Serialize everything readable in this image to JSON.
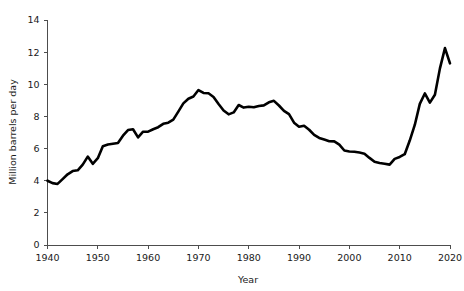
{
  "chart_data": {
    "type": "line",
    "title": "",
    "xlabel": "Year",
    "ylabel": "Million barrels per day",
    "xlim": [
      1940,
      2020
    ],
    "ylim": [
      0,
      14
    ],
    "grid": false,
    "legend": "none",
    "x_ticks": [
      1940,
      1950,
      1960,
      1970,
      1980,
      1990,
      2000,
      2010,
      2020
    ],
    "y_ticks": [
      0,
      2,
      4,
      6,
      8,
      10,
      12,
      14
    ],
    "line_color": "#000000",
    "axis_color": "#4d4d4d",
    "series": [
      {
        "name": "Million barrels per day",
        "x": [
          1940,
          1941,
          1942,
          1943,
          1944,
          1945,
          1946,
          1947,
          1948,
          1949,
          1950,
          1951,
          1952,
          1953,
          1954,
          1955,
          1956,
          1957,
          1958,
          1959,
          1960,
          1961,
          1962,
          1963,
          1964,
          1965,
          1966,
          1967,
          1968,
          1969,
          1970,
          1971,
          1972,
          1973,
          1974,
          1975,
          1976,
          1977,
          1978,
          1979,
          1980,
          1981,
          1982,
          1983,
          1984,
          1985,
          1986,
          1987,
          1988,
          1989,
          1990,
          1991,
          1992,
          1993,
          1994,
          1995,
          1996,
          1997,
          1998,
          1999,
          2000,
          2001,
          2002,
          2003,
          2004,
          2005,
          2006,
          2007,
          2008,
          2009,
          2010,
          2011,
          2012,
          2013,
          2014,
          2015,
          2016,
          2017,
          2018,
          2019,
          2020
        ],
        "y": [
          4.0,
          3.85,
          3.8,
          4.1,
          4.4,
          4.6,
          4.65,
          5.0,
          5.5,
          5.05,
          5.4,
          6.15,
          6.25,
          6.3,
          6.35,
          6.8,
          7.15,
          7.2,
          6.7,
          7.05,
          7.05,
          7.2,
          7.33,
          7.54,
          7.61,
          7.8,
          8.3,
          8.81,
          9.1,
          9.24,
          9.64,
          9.46,
          9.44,
          9.21,
          8.77,
          8.37,
          8.13,
          8.25,
          8.71,
          8.55,
          8.6,
          8.57,
          8.65,
          8.69,
          8.88,
          8.97,
          8.68,
          8.35,
          8.14,
          7.61,
          7.36,
          7.42,
          7.17,
          6.85,
          6.66,
          6.56,
          6.46,
          6.45,
          6.25,
          5.88,
          5.82,
          5.8,
          5.75,
          5.68,
          5.42,
          5.18,
          5.1,
          5.06,
          5.0,
          5.36,
          5.48,
          5.65,
          6.5,
          7.47,
          8.78,
          9.43,
          8.86,
          9.35,
          10.99,
          12.25,
          11.3
        ]
      }
    ]
  }
}
